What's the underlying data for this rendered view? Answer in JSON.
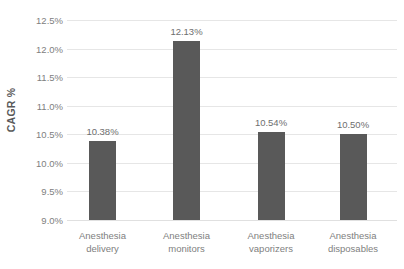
{
  "chart_data": {
    "type": "bar",
    "title": "",
    "xlabel": "",
    "ylabel": "CAGR %",
    "categories": [
      "Anesthesia delivery",
      "Anesthesia monitors",
      "Anesthesia vaporizers",
      "Anesthesia disposables"
    ],
    "category_lines": [
      [
        "Anesthesia",
        "delivery"
      ],
      [
        "Anesthesia",
        "monitors"
      ],
      [
        "Anesthesia",
        "vaporizers"
      ],
      [
        "Anesthesia",
        "disposables"
      ]
    ],
    "values": [
      10.38,
      12.13,
      10.54,
      10.5
    ],
    "value_labels": [
      "10.38%",
      "12.13%",
      "10.54%",
      "10.50%"
    ],
    "ylim": [
      9.0,
      12.5
    ],
    "ytick_values": [
      12.5,
      12.0,
      11.5,
      11.0,
      10.5,
      10.0,
      9.5,
      9.0
    ],
    "ytick_labels": [
      "12.5%",
      "12.0%",
      "11.5%",
      "11.0%",
      "10.5%",
      "10.0%",
      "9.5%",
      "9.0%"
    ],
    "grid": true,
    "legend": false,
    "bar_color": "#595959",
    "gridline_color": "#e6e6e6",
    "axis_text_color": "#808080"
  },
  "footer": {
    "clipped_text": ""
  }
}
